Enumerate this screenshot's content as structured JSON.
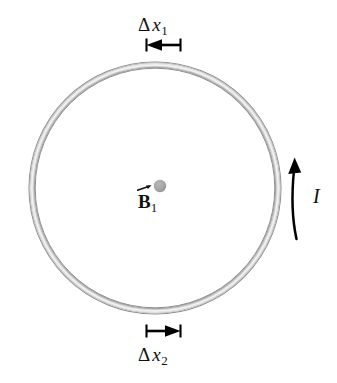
{
  "figure": {
    "canvas": {
      "width": 337,
      "height": 383,
      "background": "#ffffff"
    }
  },
  "loop": {
    "name": "circular-current-loop",
    "center_x": 155,
    "center_y": 188,
    "radius": 126,
    "band_thickness": 7,
    "color_outer": "#9a9a9a",
    "color_inner": "#d8d8d8",
    "color_highlight": "#f0f0f0"
  },
  "center_dot": {
    "name": "magnetic-field-point",
    "x": 160,
    "y": 186,
    "radius": 6,
    "color": "#a3a3a3"
  },
  "labels": {
    "delta_x1": {
      "delta": "Δ",
      "variable": "x",
      "subscript": "1"
    },
    "delta_x2": {
      "delta": "Δ",
      "variable": "x",
      "subscript": "2"
    },
    "b_field": {
      "symbol": "B",
      "subscript": "1",
      "vector_notation": "arrow-overset"
    },
    "current": {
      "symbol": "I"
    }
  },
  "segment_markers": {
    "top": {
      "name": "delta-x1-segment-marker",
      "direction": "left",
      "x_start": 146,
      "x_end": 181,
      "y": 45,
      "tick_height": 12,
      "color": "#000000"
    },
    "bottom": {
      "name": "delta-x2-segment-marker",
      "direction": "right",
      "x_start": 146,
      "x_end": 181,
      "y": 331,
      "tick_height": 12,
      "color": "#000000"
    }
  },
  "current_arrow": {
    "name": "current-direction-arrow",
    "direction": "counterclockwise-upward",
    "color": "#000000",
    "path_start": {
      "x": 296,
      "y": 238
    },
    "path_end": {
      "x": 295,
      "y": 160
    }
  },
  "colors": {
    "ink": "#111111",
    "loop_gray": "#b5b5b5",
    "dot_gray": "#a3a3a3"
  }
}
